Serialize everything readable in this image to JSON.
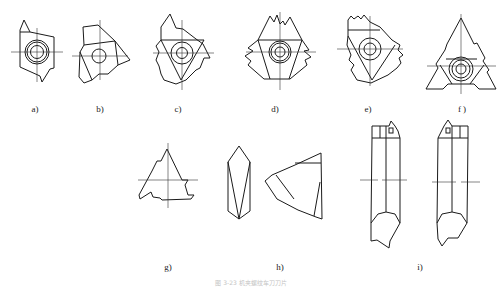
{
  "figure": {
    "caption": "图 3-23  机夹螺纹车刀刀片",
    "panels": [
      {
        "id": "a",
        "label": "a)",
        "shape": "hexagonal insert with two cutting teeth and center hole",
        "label_pos": [
          35,
          98
        ]
      },
      {
        "id": "b",
        "label": "b)",
        "shape": "irregular three-lobed insert with center hole",
        "label_pos": [
          100,
          98
        ]
      },
      {
        "id": "c",
        "label": "c)",
        "shape": "triangular-pocket insert with jagged profile edges",
        "label_pos": [
          178,
          98
        ]
      },
      {
        "id": "d",
        "label": "d)",
        "shape": "triangular insert with three multi-tooth corners",
        "label_pos": [
          275,
          98
        ]
      },
      {
        "id": "e",
        "label": "e)",
        "shape": "insert with serrated multi-tooth edges",
        "label_pos": [
          368,
          98
        ]
      },
      {
        "id": "f",
        "label": "f )",
        "shape": "full triangle insert with notched sides",
        "label_pos": [
          462,
          98
        ]
      },
      {
        "id": "g",
        "label": "g)",
        "shape": "partial triangular insert with notch",
        "label_pos": [
          168,
          268
        ]
      },
      {
        "id": "h",
        "label": "h)",
        "shape": "elongated diamond insert and triangular insert top view",
        "label_pos": [
          280,
          268
        ]
      },
      {
        "id": "i",
        "label": "i)",
        "shape": "two threading tool shanks with brazed tip, front views",
        "label_pos": [
          420,
          268
        ]
      }
    ]
  }
}
